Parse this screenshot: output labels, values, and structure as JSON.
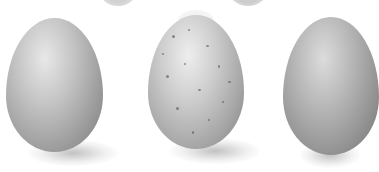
{
  "scene": {
    "description": "Illustration of three bird eggs on a white background with soft shadows",
    "background": "#ffffff",
    "eggs": [
      {
        "label": "egg-left",
        "pattern": "plain",
        "base_color": "#9a9a9a",
        "highlight": "#e6e6e6"
      },
      {
        "label": "egg-center",
        "pattern": "speckled",
        "base_color": "#a8a8a8",
        "highlight": "#ececec"
      },
      {
        "label": "egg-right",
        "pattern": "finely-speckled",
        "base_color": "#8f8f8f",
        "highlight": "#d8d8d8"
      }
    ],
    "partial_eggs_top": 3
  }
}
